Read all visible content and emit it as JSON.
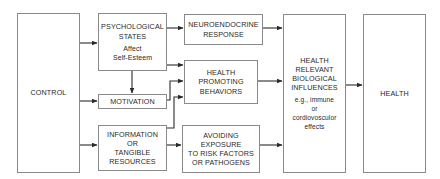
{
  "diagram": {
    "nodes": {
      "control": {
        "label": "CONTROL"
      },
      "psychological_states": {
        "lines": [
          "PSYCHOLOGICAL",
          "STATES"
        ],
        "sub": [
          "Affect",
          "Self-Esteem"
        ]
      },
      "motivation": {
        "label": "MOTIVATION"
      },
      "information": {
        "lines": [
          "INFORMATION",
          "OR",
          "TANGIBLE",
          "RESOURCES"
        ]
      },
      "neuroendocrine": {
        "lines": [
          "NEUROENDOCRINE",
          "RESPONSE"
        ]
      },
      "health_promoting": {
        "lines": [
          "HEALTH",
          "PROMOTING",
          "BEHAVIORS"
        ]
      },
      "avoiding_exposure": {
        "lines": [
          "AVOIDING",
          "EXPOSURE",
          "TO RISK FACTORS",
          "OR PATHOGENS"
        ]
      },
      "biological_influences": {
        "lines": [
          "HEALTH",
          "RELEVANT",
          "BIOLOGICAL",
          "INFLUENCES"
        ],
        "sub": [
          "e.g., immune",
          "or",
          "cordiovosculor",
          "effects"
        ]
      },
      "health": {
        "label": "HEALTH"
      }
    },
    "edges": [
      {
        "from": "control",
        "to": "psychological_states"
      },
      {
        "from": "control",
        "to": "motivation"
      },
      {
        "from": "control",
        "to": "information"
      },
      {
        "from": "psychological_states",
        "to": "motivation"
      },
      {
        "from": "psychological_states",
        "to": "neuroendocrine"
      },
      {
        "from": "psychological_states",
        "to": "health_promoting"
      },
      {
        "from": "motivation",
        "to": "health_promoting"
      },
      {
        "from": "information",
        "to": "health_promoting"
      },
      {
        "from": "information",
        "to": "avoiding_exposure"
      },
      {
        "from": "neuroendocrine",
        "to": "biological_influences"
      },
      {
        "from": "health_promoting",
        "to": "biological_influences"
      },
      {
        "from": "avoiding_exposure",
        "to": "biological_influences"
      },
      {
        "from": "biological_influences",
        "to": "health"
      }
    ],
    "colors": {
      "line": "#2a2a2a",
      "border": "#8a8a8a",
      "background": "#ffffff"
    }
  }
}
